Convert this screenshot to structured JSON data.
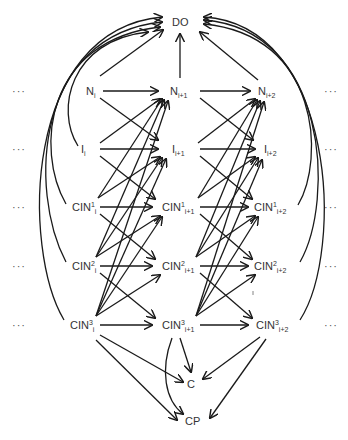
{
  "diagram": {
    "type": "dynamic-bayesian-network",
    "nodes": [
      {
        "id": "DO",
        "base": "DO",
        "sup": "",
        "sub": "",
        "x": 172,
        "y": 16
      },
      {
        "id": "N_i",
        "base": "N",
        "sup": "",
        "sub": "i",
        "x": 86,
        "y": 85
      },
      {
        "id": "N_i+1",
        "base": "N",
        "sup": "",
        "sub": "i+1",
        "x": 170,
        "y": 85
      },
      {
        "id": "N_i+2",
        "base": "N",
        "sup": "",
        "sub": "i+2",
        "x": 258,
        "y": 85
      },
      {
        "id": "I_i",
        "base": "I",
        "sup": "",
        "sub": "i",
        "x": 81,
        "y": 143
      },
      {
        "id": "I_i+1",
        "base": "I",
        "sup": "",
        "sub": "i+1",
        "x": 172,
        "y": 143
      },
      {
        "id": "I_i+2",
        "base": "I",
        "sup": "",
        "sub": "i+2",
        "x": 264,
        "y": 143
      },
      {
        "id": "CIN1_i",
        "base": "CIN",
        "sup": "1",
        "sub": "i",
        "x": 72,
        "y": 201
      },
      {
        "id": "CIN1_i+1",
        "base": "CIN",
        "sup": "1",
        "sub": "i+1",
        "x": 162,
        "y": 201
      },
      {
        "id": "CIN1_i+2",
        "base": "CIN",
        "sup": "1",
        "sub": "i+2",
        "x": 254,
        "y": 201
      },
      {
        "id": "CIN2_i",
        "base": "CIN",
        "sup": "2",
        "sub": "i",
        "x": 72,
        "y": 260
      },
      {
        "id": "CIN2_i+1",
        "base": "CIN",
        "sup": "2",
        "sub": "i+1",
        "x": 162,
        "y": 260
      },
      {
        "id": "CIN2_i+2",
        "base": "CIN",
        "sup": "2",
        "sub": "i+2",
        "x": 254,
        "y": 260
      },
      {
        "id": "CIN3_i",
        "base": "CIN",
        "sup": "3",
        "sub": "i",
        "x": 70,
        "y": 319
      },
      {
        "id": "CIN3_i+1",
        "base": "CIN",
        "sup": "3",
        "sub": "i+1",
        "x": 162,
        "y": 319
      },
      {
        "id": "CIN3_i+2",
        "base": "CIN",
        "sup": "3",
        "sub": "i+2",
        "x": 256,
        "y": 319
      },
      {
        "id": "C",
        "base": "C",
        "sup": "",
        "sub": "",
        "x": 187,
        "y": 378
      },
      {
        "id": "CP",
        "base": "CP",
        "sup": "",
        "sub": "",
        "x": 185,
        "y": 415
      }
    ],
    "ellipsis": "···",
    "ellipsis_rows": [
      {
        "left_x": 12,
        "right_x": 324,
        "y": 85
      },
      {
        "left_x": 12,
        "right_x": 324,
        "y": 143
      },
      {
        "left_x": 12,
        "right_x": 324,
        "y": 201
      },
      {
        "left_x": 12,
        "right_x": 324,
        "y": 260
      },
      {
        "left_x": 12,
        "right_x": 324,
        "y": 319
      }
    ],
    "line_color": "#1a1a1a",
    "text_color": "#333333"
  }
}
